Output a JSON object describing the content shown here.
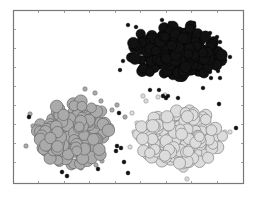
{
  "chart_data": {
    "type": "scatter",
    "title": "",
    "xlabel": "",
    "ylabel": "",
    "grid": false,
    "legend": null,
    "tick_labels_visible": false,
    "frame": {
      "x0": 13,
      "y0": 10,
      "x1": 243,
      "y1": 183,
      "color": "#777777"
    },
    "x_ticks_px": [
      38,
      64,
      89,
      115,
      140,
      166,
      191,
      217
    ],
    "y_ticks_px": [
      29,
      48,
      67,
      86,
      105,
      124,
      143,
      162
    ],
    "series": [
      {
        "name": "cluster-black",
        "fill": "#111111",
        "stroke": "#000000",
        "center_px": [
          175,
          52
        ],
        "spread_px": [
          22,
          13
        ],
        "count": 260,
        "radius": 5.2,
        "seed": 11,
        "outliers": [
          [
            128,
            25
          ],
          [
            136,
            27
          ],
          [
            162,
            20
          ],
          [
            170,
            23
          ],
          [
            194,
            23
          ],
          [
            210,
            33
          ],
          [
            217,
            37
          ],
          [
            220,
            42
          ],
          [
            218,
            57
          ],
          [
            230,
            57
          ],
          [
            210,
            72
          ],
          [
            218,
            71
          ],
          [
            211,
            78
          ],
          [
            220,
            78
          ],
          [
            203,
            88
          ],
          [
            150,
            90
          ],
          [
            159,
            90
          ],
          [
            168,
            96
          ],
          [
            178,
            98
          ],
          [
            123,
            61
          ],
          [
            120,
            70
          ]
        ]
      },
      {
        "name": "cluster-mid-gray",
        "fill": "#aaaaaa",
        "stroke": "#6f6f6f",
        "center_px": [
          73,
          133
        ],
        "spread_px": [
          18,
          15
        ],
        "count": 230,
        "radius": 5.6,
        "seed": 23,
        "outliers": [
          [
            85,
            89
          ],
          [
            95,
            93
          ],
          [
            101,
            101
          ],
          [
            112,
            110
          ],
          [
            125,
            117
          ],
          [
            117,
            105
          ],
          [
            26,
            146
          ],
          [
            102,
            161
          ],
          [
            96,
            165
          ],
          [
            81,
            168
          ],
          [
            33,
            126
          ],
          [
            30,
            114
          ]
        ],
        "dark_outliers": [
          [
            29,
            117
          ],
          [
            119,
            113
          ],
          [
            117,
            146
          ],
          [
            121,
            148
          ],
          [
            116,
            151
          ],
          [
            124,
            162
          ],
          [
            62,
            172
          ],
          [
            67,
            176
          ],
          [
            98,
            169
          ]
        ]
      },
      {
        "name": "cluster-light-gray",
        "fill": "#dcdcdc",
        "stroke": "#8e8e8e",
        "center_px": [
          180,
          137
        ],
        "spread_px": [
          20,
          14
        ],
        "count": 230,
        "radius": 5.6,
        "seed": 37,
        "outliers": [
          [
            143,
            96
          ],
          [
            146,
            101
          ],
          [
            158,
            97
          ],
          [
            165,
            95
          ],
          [
            132,
            113
          ],
          [
            137,
            123
          ],
          [
            140,
            127
          ],
          [
            130,
            147
          ],
          [
            152,
            160
          ],
          [
            187,
            179
          ],
          [
            225,
            132
          ],
          [
            230,
            132
          ],
          [
            134,
            132
          ]
        ],
        "dark_outliers": [
          [
            163,
            96
          ],
          [
            166,
            98
          ],
          [
            219,
            104
          ],
          [
            236,
            128
          ],
          [
            128,
            173
          ]
        ]
      }
    ]
  }
}
